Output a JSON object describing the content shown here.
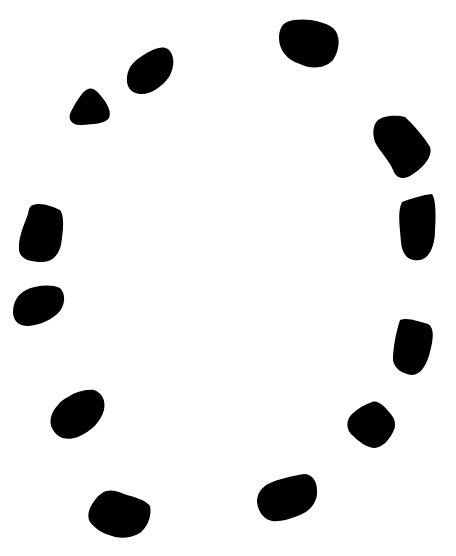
{
  "canvas": {
    "width": 456,
    "height": 556,
    "background": "#ffffff",
    "ink": "#000000"
  },
  "blobs": [
    {
      "id": "blob-top",
      "d": "M287,22 C300,17 322,20 333,28 C341,35 340,50 333,60 C326,68 312,70 300,64 C287,60 279,50 279,38 C279,30 282,24 287,22 Z"
    },
    {
      "id": "blob-upper-left",
      "d": "M142,56 C152,49 162,45 168,49 C175,55 175,67 169,77 C162,87 150,95 140,94 C130,93 126,86 127,77 C128,67 134,61 142,56 Z"
    },
    {
      "id": "blob-triangle",
      "d": "M86,90 C92,86 96,90 101,96 C107,103 112,112 109,118 C105,124 93,124 82,125 C73,126 68,120 70,114 C74,105 80,95 86,90 Z"
    },
    {
      "id": "blob-right-upper",
      "d": "M378,120 C385,115 398,115 405,117 C413,124 424,137 430,147 C433,156 424,167 413,174 C405,180 397,180 393,170 C389,160 380,152 375,142 C372,133 373,125 378,120 Z"
    },
    {
      "id": "blob-right-middle",
      "d": "M402,202 C412,198 423,195 432,194 C436,200 436,215 435,230 C435,245 430,258 420,260 C408,262 402,254 401,242 C400,228 397,212 402,202 Z"
    },
    {
      "id": "blob-left-upper",
      "d": "M33,205 C40,202 52,206 60,210 C65,216 63,232 61,245 C58,256 52,262 42,262 C30,262 20,259 19,250 C18,238 24,225 28,214 C29,208 30,206 33,205 Z"
    },
    {
      "id": "blob-left-lower",
      "d": "M26,290 C36,285 52,284 60,288 C66,294 65,304 60,311 C52,320 40,325 28,326 C18,326 13,320 13,312 C13,302 18,294 26,290 Z"
    },
    {
      "id": "blob-right-lower",
      "d": "M400,320 C408,317 420,322 428,324 C435,328 433,340 430,352 C427,364 421,375 412,375 C402,374 394,368 393,360 C393,348 396,332 400,320 Z"
    },
    {
      "id": "blob-left-bottom",
      "d": "M68,397 C75,392 86,389 94,390 C102,393 106,400 104,410 C101,421 92,431 78,437 C66,441 58,438 53,430 C48,422 51,412 58,405 C61,401 64,399 68,397 Z"
    },
    {
      "id": "blob-right-bottom",
      "d": "M372,402 C378,400 384,406 389,412 C395,418 397,425 393,432 C389,440 383,447 375,448 C367,448 358,441 351,434 C346,428 346,420 352,414 C358,408 366,404 372,402 Z"
    },
    {
      "id": "blob-bottom-right",
      "d": "M268,484 C278,479 292,476 304,474 C312,474 317,481 317,490 C318,500 312,510 300,515 C290,519 280,522 272,521 C263,519 258,511 257,502 C257,494 261,488 268,484 Z"
    },
    {
      "id": "blob-bottom-left",
      "d": "M101,494 C107,489 115,490 124,494 C134,497 146,500 150,506 C152,515 148,527 140,533 C132,538 120,539 112,536 C104,534 95,529 90,522 C86,515 90,506 95,500 C97,497 99,495 101,494 Z"
    }
  ]
}
